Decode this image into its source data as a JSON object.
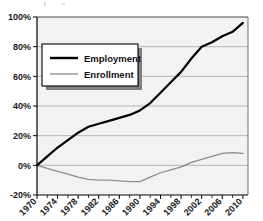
{
  "chart_data": {
    "type": "line",
    "title": "",
    "xlabel": "",
    "ylabel": "",
    "xlim": [
      1970,
      2011
    ],
    "ylim": [
      -20,
      100
    ],
    "grid": true,
    "grid_axis": "y",
    "legend_position": "upper-left-inside",
    "y_ticks": [
      "-20%",
      "0%",
      "20%",
      "40%",
      "60%",
      "80%",
      "100%"
    ],
    "y_tick_values": [
      -20,
      0,
      20,
      40,
      60,
      80,
      100
    ],
    "x_ticks": [
      "1970",
      "1974",
      "1978",
      "1982",
      "1986",
      "1990",
      "1994",
      "1998",
      "2002",
      "2006",
      "2010"
    ],
    "x_tick_values": [
      1970,
      1974,
      1978,
      1982,
      1986,
      1990,
      1994,
      1998,
      2002,
      2006,
      2010
    ],
    "x_minor_tick_interval": 2,
    "x_tick_label_rotation": -45,
    "colors": {
      "employment_line": "#000000",
      "enrollment_line": "#8c8c8c",
      "plot_background": "#f2f2f2",
      "gridline": "#a6a6a6",
      "axis": "#000000",
      "legend_background": "#ffffff",
      "legend_border": "#000000",
      "legend_shadow": "#808080"
    },
    "series": [
      {
        "name": "Employment",
        "color": "#000000",
        "line_width": 2.2,
        "x": [
          1970,
          1972,
          1974,
          1976,
          1978,
          1980,
          1982,
          1984,
          1986,
          1988,
          1990,
          1992,
          1994,
          1996,
          1998,
          2000,
          2002,
          2004,
          2006,
          2008,
          2010
        ],
        "values": [
          0,
          6,
          12,
          17,
          22,
          26,
          28,
          30,
          32,
          34,
          37,
          42,
          49,
          56,
          63,
          72,
          80,
          83,
          87,
          90,
          96
        ]
      },
      {
        "name": "Enrollment",
        "color": "#8c8c8c",
        "line_width": 1.3,
        "x": [
          1970,
          1972,
          1974,
          1976,
          1978,
          1980,
          1982,
          1984,
          1986,
          1988,
          1990,
          1992,
          1994,
          1996,
          1998,
          2000,
          2002,
          2004,
          2006,
          2008,
          2010
        ],
        "values": [
          0,
          -2,
          -4,
          -6,
          -8,
          -9.5,
          -10,
          -10,
          -10.5,
          -11,
          -11,
          -8,
          -5,
          -3,
          -1,
          2,
          4,
          6,
          8,
          8.5,
          8
        ]
      }
    ]
  },
  "legend": {
    "items": [
      {
        "label": "Employment",
        "color": "#000000",
        "width": 2.4
      },
      {
        "label": "Enrollment",
        "color": "#8c8c8c",
        "width": 1.3
      }
    ]
  }
}
